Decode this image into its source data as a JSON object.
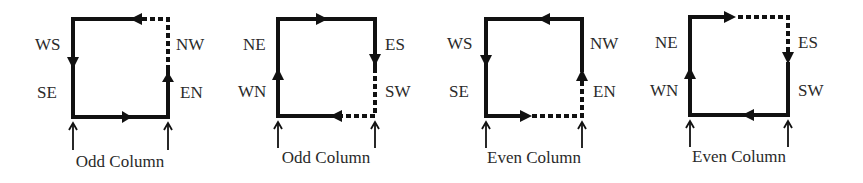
{
  "diagrams": [
    {
      "caption": "Odd Column",
      "labels": {
        "top_left": "WS",
        "bottom_left": "SE",
        "top_right": "NW",
        "bottom_right": "EN"
      },
      "loop": "counter-clockwise: up right side (dashed upper right), left along top, down left side, right along bottom"
    },
    {
      "caption": "Odd Column",
      "labels": {
        "top_left": "NE",
        "bottom_left": "WN",
        "top_right": "ES",
        "bottom_right": "SW"
      },
      "loop": "clockwise: up left side, right along top, down right side (dashed lower right), left along bottom (dashed right part)"
    },
    {
      "caption": "Even Column",
      "labels": {
        "top_left": "WS",
        "bottom_left": "SE",
        "top_right": "NW",
        "bottom_right": "EN"
      },
      "loop": "counter-clockwise: right along bottom (dashed right part), up right side (dashed lower), left along top, down left side"
    },
    {
      "caption": "Even Column",
      "labels": {
        "top_left": "NE",
        "bottom_left": "WN",
        "top_right": "ES",
        "bottom_right": "SW"
      },
      "loop": "clockwise: up left side, right along top (dashed right part), down right side (dashed upper), left along bottom"
    }
  ]
}
